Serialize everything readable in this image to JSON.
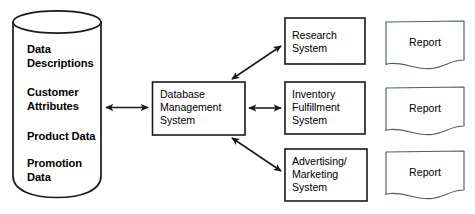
{
  "diagram": {
    "type": "flow-diagram",
    "colors": {
      "stroke": "#1a1a1a",
      "fill": "#ffffff",
      "text": "#000000",
      "background": "#ffffff"
    },
    "data_store": {
      "icon": "cylinder-database-icon",
      "shape": "cylinder",
      "items": [
        {
          "label": "Data\nDescriptions"
        },
        {
          "label": "Customer\nAttributes"
        },
        {
          "label": "Product Data"
        },
        {
          "label": "Promotion\nData"
        }
      ]
    },
    "process": {
      "label": "Database\nManagement\nSystem",
      "shape": "rectangle"
    },
    "systems": [
      {
        "label": "Research\nSystem",
        "shape": "rectangle"
      },
      {
        "label": "Inventory\nFulfillment\nSystem",
        "shape": "rectangle"
      },
      {
        "label": "Advertising/\nMarketing\nSystem",
        "shape": "rectangle"
      }
    ],
    "outputs": [
      {
        "label": "Report",
        "shape": "document"
      },
      {
        "label": "Report",
        "shape": "document"
      },
      {
        "label": "Report",
        "shape": "document"
      }
    ],
    "connectors": [
      {
        "from": "data_store",
        "to": "process",
        "style": "double-arrow",
        "orientation": "horizontal"
      },
      {
        "from": "process",
        "to": "systems.0",
        "style": "double-arrow",
        "orientation": "diagonal-up"
      },
      {
        "from": "process",
        "to": "systems.1",
        "style": "double-arrow",
        "orientation": "horizontal"
      },
      {
        "from": "process",
        "to": "systems.2",
        "style": "double-arrow",
        "orientation": "diagonal-down"
      }
    ]
  }
}
